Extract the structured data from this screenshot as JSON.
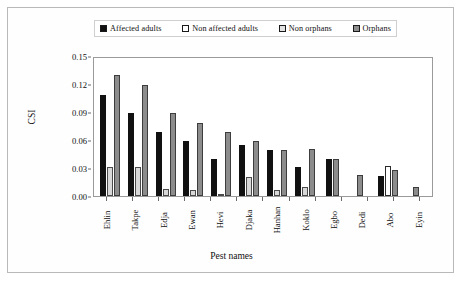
{
  "chart_data": {
    "type": "bar",
    "title": "",
    "xlabel": "Pest names",
    "ylabel": "CSI",
    "ylim": [
      0,
      0.15
    ],
    "ytick_labels": [
      "0.15",
      "0.12",
      "0.09",
      "0.06",
      "0.03",
      "0.00"
    ],
    "ytick_values": [
      0.15,
      0.12,
      0.09,
      0.06,
      0.03,
      0.0
    ],
    "grid": false,
    "legend_position": "top",
    "categories": [
      "Ehlin",
      "Takpe",
      "Edja",
      "Ewan",
      "Hevi",
      "Djaka",
      "Hanhan",
      "Koklo",
      "Egbo",
      "Dedi",
      "Abo",
      "Eyin"
    ],
    "series": [
      {
        "name": "Affected adults",
        "color": "#111111",
        "style": "solid-black",
        "values": [
          0.11,
          0.09,
          0.07,
          0.06,
          0.04,
          0.055,
          0.05,
          0.031,
          0.04,
          0.0,
          0.022,
          0.0
        ]
      },
      {
        "name": "Non affected adults",
        "color": "#ffffff",
        "style": "open-white",
        "values": [
          0.0,
          0.0,
          0.0,
          0.0,
          0.0,
          0.0,
          0.0,
          0.0,
          0.0,
          0.0,
          0.033,
          0.0
        ]
      },
      {
        "name": "Non orphans",
        "color": "#d8d8d8",
        "style": "light-gray",
        "values": [
          0.031,
          0.031,
          0.008,
          0.006,
          0.002,
          0.021,
          0.006,
          0.01,
          0.0,
          0.0,
          0.0,
          0.0
        ]
      },
      {
        "name": "Orphans",
        "color": "#8c8c8c",
        "style": "dark-gray",
        "values": [
          0.132,
          0.121,
          0.09,
          0.079,
          0.07,
          0.06,
          0.05,
          0.051,
          0.04,
          0.023,
          0.028,
          0.01
        ]
      }
    ]
  },
  "legend": {
    "items": [
      {
        "label": "Affected adults",
        "swatch": "sw-black"
      },
      {
        "label": "Non affected adults",
        "swatch": "sw-white"
      },
      {
        "label": "Non orphans",
        "swatch": "sw-lgray"
      },
      {
        "label": "Orphans",
        "swatch": "sw-dgray"
      }
    ]
  }
}
